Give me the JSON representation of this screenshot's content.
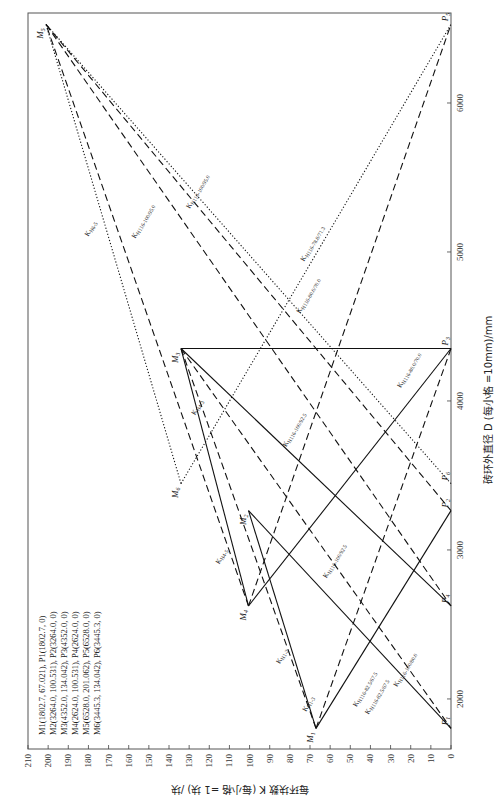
{
  "chart_data": {
    "type": "line",
    "orientation": "rotated-90-clockwise",
    "title": "",
    "xlabel": "砖环外直径 D (每小格 =10mm)/mm",
    "ylabel": "每环块数 K (每小格 =1 块) /块",
    "x_axis": {
      "range": [
        1664,
        6604
      ],
      "ticks": [
        2000,
        3000,
        4000,
        5000,
        6000
      ]
    },
    "y_axis": {
      "range": [
        0,
        210
      ],
      "ticks": [
        0,
        10,
        20,
        30,
        40,
        50,
        60,
        70,
        80,
        90,
        100,
        110,
        120,
        130,
        140,
        150,
        160,
        170,
        180,
        190,
        200,
        210
      ]
    },
    "grid": false,
    "points": {
      "M1": {
        "D": 1802.7,
        "K": 67.021
      },
      "M2": {
        "D": 3264.0,
        "K": 100.531
      },
      "M3": {
        "D": 4352.0,
        "K": 134.042
      },
      "M4": {
        "D": 2624.0,
        "K": 100.531
      },
      "M5": {
        "D": 6528.0,
        "K": 201.062
      },
      "M6": {
        "D": 3445.3,
        "K": 134.042
      },
      "P1": {
        "D": 1802.7,
        "K": 0
      },
      "P2": {
        "D": 3264.0,
        "K": 0
      },
      "P3": {
        "D": 4352.0,
        "K": 0
      },
      "P4": {
        "D": 2624.0,
        "K": 0
      },
      "P5": {
        "D": 6528.0,
        "K": 0
      },
      "P6": {
        "D": 3445.3,
        "K": 0
      }
    },
    "series": [
      {
        "name": "K_H1-3",
        "style": "dashed",
        "from": "M1",
        "to": "M3"
      },
      {
        "name": "K_H1-2",
        "style": "solid",
        "from": "M1",
        "to": "M2"
      },
      {
        "name": "K_H116-82.5/67.5 (dashed)",
        "style": "dashed",
        "from": "M1",
        "to": "P3"
      },
      {
        "name": "K_H116-82.5/67.5 (solid)",
        "style": "solid",
        "from": "M1",
        "to": "P2"
      },
      {
        "name": "K_H116-100/80.0",
        "style": "solid",
        "from": "M2",
        "to": "P1"
      },
      {
        "name": "K_H4-5",
        "style": "dashed",
        "from": "M4",
        "to": "M5"
      },
      {
        "name": "K_H4-3",
        "style": "solid",
        "from": "M4",
        "to": "M3"
      },
      {
        "name": "K_M4-P3",
        "style": "solid",
        "from": "M4",
        "to": "P3"
      },
      {
        "name": "K_H116-100/92.5 (solid)",
        "style": "solid",
        "from": "M3",
        "to": "P4"
      },
      {
        "name": "K_H116-100/92.5 (dashed)",
        "style": "dashed",
        "from": "M3",
        "to": "P1"
      },
      {
        "name": "K_H116-80.0/70.0 (solid)",
        "style": "solid",
        "from": "M3",
        "to": "P3"
      },
      {
        "name": "K_H116-100/95.0 (dashed)",
        "style": "dashed",
        "from": "M5",
        "to": "P4"
      },
      {
        "name": "K_H116-100/95.0 (dotted)",
        "style": "dotted",
        "from": "M5",
        "to": "P6"
      },
      {
        "name": "K_H6-5",
        "style": "dotted",
        "from": "M6",
        "to": "M5"
      },
      {
        "name": "K_H116-78.8/71.3",
        "style": "dotted",
        "from": "M6",
        "to": "P5"
      },
      {
        "name": "K_H116-80.0/70.0 (dashed)",
        "style": "dashed",
        "from": "M4",
        "to": "P5"
      },
      {
        "name": "K_M5-P2",
        "style": "dashed",
        "from": "M5",
        "to": "P2"
      }
    ],
    "legend": [
      "M1(1802.7, 67.021), P1(1802.7, 0)",
      "M2(3264.0, 100.531), P2(3264.0, 0)",
      "M3(4352.0, 134.042), P3(4352.0, 0)",
      "M4(2624.0, 100.531), P4(2624.0, 0)",
      "M5(6528.0, 201.062), P5(6528.0, 0)",
      "M6(3445.3, 134.042), P6(3445.3, 0)"
    ],
    "line_labels": [
      {
        "text": "K_H1-3",
        "at": [
          1960,
          70
        ]
      },
      {
        "text": "K_H1-2",
        "at": [
          2280,
          83
        ]
      },
      {
        "text": "K_H116-82.5/67.5",
        "at": [
          2060,
          42
        ]
      },
      {
        "text": "K_H116-82.5/67.5",
        "at": [
          2010,
          36
        ]
      },
      {
        "text": "K_H116-100/80.0",
        "at": [
          2190,
          22
        ]
      },
      {
        "text": "K_H4-5",
        "at": [
          2950,
          113
        ]
      },
      {
        "text": "K_H4-3",
        "at": [
          3950,
          125
        ]
      },
      {
        "text": "K_H116-100/92.5",
        "at": [
          3800,
          77
        ]
      },
      {
        "text": "K_H116-100/92.5",
        "at": [
          2920,
          57
        ]
      },
      {
        "text": "K_H116-80.0/70.0",
        "at": [
          4200,
          20
        ]
      },
      {
        "text": "K_H116-100/95.0",
        "at": [
          5200,
          152
        ]
      },
      {
        "text": "K_H116-100/95.0",
        "at": [
          5400,
          125
        ]
      },
      {
        "text": "K_H6-5",
        "at": [
          5150,
          178
        ]
      },
      {
        "text": "K_H116-78.8/71.3",
        "at": [
          5050,
          68
        ]
      },
      {
        "text": "K_H116-80.0/70.0",
        "at": [
          4700,
          70
        ]
      }
    ]
  },
  "labels": {
    "xlabel": "砖环外直径 D (每小格 =10mm)/mm",
    "ylabel": "每环块数 K (每小格 =1 块) /块",
    "legend": [
      "M1(1802.7, 67.021),  P1(1802.7, 0)",
      "M2(3264.0, 100.531), P2(3264.0, 0)",
      "M3(4352.0, 134.042), P3(4352.0, 0)",
      "M4(2624.0, 100.531), P4(2624.0, 0)",
      "M5(6528.0, 201.062), P5(6528.0, 0)",
      "M6(3445.3, 134.042), P6(3445.3, 0)"
    ]
  }
}
